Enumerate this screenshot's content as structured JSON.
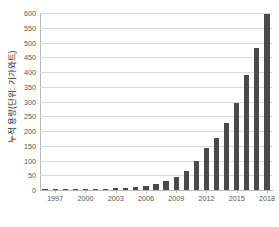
{
  "chart_data": {
    "type": "bar",
    "title": "",
    "xlabel": "",
    "ylabel": "누적 용량(단위: 기가와트)",
    "ylabel_parts": {
      "main": "누적 용량",
      "unit": "(단위: 기가와트)"
    },
    "ylim": [
      0,
      600
    ],
    "ytick_labels": [
      "0",
      "50",
      "100",
      "150",
      "200",
      "250",
      "300",
      "350",
      "400",
      "450",
      "500",
      "550",
      "600"
    ],
    "ytick_values": [
      0,
      50,
      100,
      150,
      200,
      250,
      300,
      350,
      400,
      450,
      500,
      550,
      600
    ],
    "grid": true,
    "legend": "none",
    "bar_color": "#4a4a4a",
    "grid_color": "#d9d9d9",
    "axis_color": "#b9b9b9",
    "categories": [
      "1996",
      "1997",
      "1998",
      "1999",
      "2000",
      "2001",
      "2002",
      "2003",
      "2004",
      "2005",
      "2006",
      "2007",
      "2008",
      "2009",
      "2010",
      "2011",
      "2012",
      "2013",
      "2014",
      "2015",
      "2016",
      "2017",
      "2018"
    ],
    "xtick_labels": [
      "1997",
      "2000",
      "2003",
      "2006",
      "2009",
      "2012",
      "2015",
      "2018"
    ],
    "xtick_categories": [
      "1997",
      "2000",
      "2003",
      "2006",
      "2009",
      "2012",
      "2015",
      "2018"
    ],
    "values": [
      0.7,
      1.0,
      1.3,
      1.8,
      2.5,
      3.5,
      4.7,
      6.0,
      8.0,
      11,
      15,
      21,
      31,
      45,
      65,
      97,
      142,
      177,
      228,
      296,
      390,
      480,
      595
    ]
  }
}
